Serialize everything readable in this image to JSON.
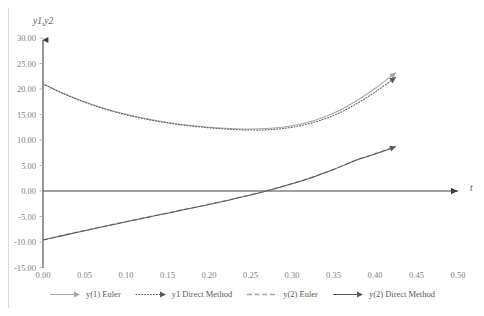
{
  "chart_data": {
    "type": "line",
    "title": "",
    "xlabel": "t",
    "ylabel": "y1,y2",
    "xlim": [
      0.0,
      0.5
    ],
    "ylim": [
      -15.0,
      30.0
    ],
    "grid": false,
    "legend_position": "bottom",
    "xticks": [
      "0.00",
      "0.05",
      "0.10",
      "0.15",
      "0.20",
      "0.25",
      "0.30",
      "0.35",
      "0.40",
      "0.45",
      "0.50"
    ],
    "xtick_values": [
      0.0,
      0.05,
      0.1,
      0.15,
      0.2,
      0.25,
      0.3,
      0.35,
      0.4,
      0.45,
      0.5
    ],
    "yticks": [
      "30.00",
      "25.00",
      "20.00",
      "15.00",
      "10.00",
      "5.00",
      "0.00",
      "-5.00",
      "-10.00",
      "-15.00"
    ],
    "ytick_values": [
      30.0,
      25.0,
      20.0,
      15.0,
      10.0,
      5.0,
      0.0,
      -5.0,
      -10.0,
      -15.0
    ],
    "x": [
      0.0,
      0.025,
      0.05,
      0.075,
      0.1,
      0.125,
      0.15,
      0.175,
      0.2,
      0.225,
      0.25,
      0.275,
      0.3,
      0.325,
      0.35,
      0.375,
      0.4,
      0.425
    ],
    "series": [
      {
        "name": "y(1) Euler",
        "style": "solid",
        "color": "#a6a6a6",
        "marker": "arrow-end",
        "values": [
          21.0,
          19.1,
          17.5,
          16.15,
          15.05,
          14.15,
          13.45,
          12.9,
          12.5,
          12.25,
          12.15,
          12.3,
          12.8,
          13.75,
          15.25,
          17.4,
          20.1,
          23.2
        ]
      },
      {
        "name": "y1 Direct Method",
        "style": "dotted",
        "color": "#595959",
        "marker": "arrow-end",
        "values": [
          21.0,
          19.05,
          17.4,
          16.05,
          14.95,
          14.05,
          13.35,
          12.8,
          12.4,
          12.1,
          11.95,
          12.05,
          12.5,
          13.4,
          14.8,
          16.85,
          19.4,
          22.3
        ]
      },
      {
        "name": "y(2) Euler",
        "style": "dashed",
        "color": "#a6a6a6",
        "marker": "arrow-end",
        "values": [
          -9.6,
          -8.65,
          -7.75,
          -6.85,
          -6.0,
          -5.15,
          -4.3,
          -3.45,
          -2.6,
          -1.7,
          -0.75,
          0.3,
          1.45,
          2.75,
          4.25,
          5.95,
          7.3,
          8.8
        ]
      },
      {
        "name": "y(2) Direct Method",
        "style": "solid",
        "color": "#595959",
        "marker": "arrow-end",
        "values": [
          -9.6,
          -8.7,
          -7.8,
          -6.9,
          -6.05,
          -5.2,
          -4.35,
          -3.5,
          -2.65,
          -1.75,
          -0.8,
          0.25,
          1.4,
          2.7,
          4.2,
          5.9,
          7.25,
          8.7
        ]
      }
    ]
  },
  "axis": {
    "y_title": "y1,y2",
    "x_title": "t"
  },
  "legend": {
    "items": [
      {
        "label": "y(1) Euler"
      },
      {
        "label": "y1 Direct Method"
      },
      {
        "label": "y(2) Euler"
      },
      {
        "label": "y(2) Direct Method"
      }
    ]
  },
  "colors": {
    "series_light": "#a6a6a6",
    "series_dark": "#595959",
    "axis": "#404040",
    "tick_text": "#7f7f7f",
    "frame": "#d9d9d9"
  }
}
